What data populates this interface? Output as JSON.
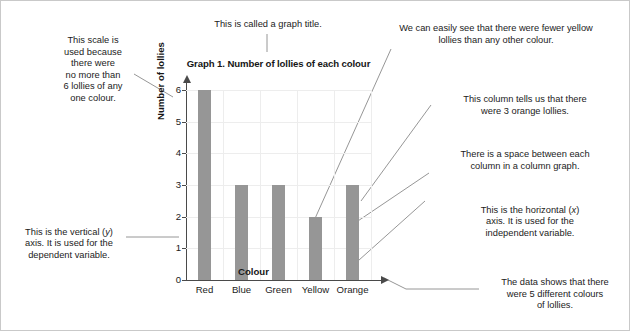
{
  "chart_data": {
    "type": "bar",
    "title": "Graph 1. Number of lollies of each colour",
    "categories": [
      "Red",
      "Blue",
      "Green",
      "Yellow",
      "Orange"
    ],
    "values": [
      6,
      3,
      3,
      2,
      3
    ],
    "xlabel": "Colour",
    "ylabel": "Number of lollies",
    "ylim": [
      0,
      6
    ],
    "yticks": [
      "0",
      "1",
      "2",
      "3",
      "4",
      "5",
      "6"
    ],
    "grid": true,
    "legend": "none",
    "bar_color": "#969696",
    "axis_color": "#4a4a4a",
    "grid_color": "#ededed"
  },
  "annotations": {
    "scale": "This scale is\nused because\nthere were\nno more than\n6 lollies of any\none colour.",
    "title_note": "This is called a graph title.",
    "yellow_note": "We can easily see that there were fewer yellow\nlollies than any other colour.",
    "orange_note": "This column tells us that there\nwere 3 orange lollies.",
    "space_note": "There is a space between each\ncolumn in a column graph.",
    "x_axis_note_pre": "This is the horizontal (",
    "x_axis_note_var": "x",
    "x_axis_note_post": ")\naxis. It is used for the\nindependent variable.",
    "y_axis_note_pre": "This is the vertical (",
    "y_axis_note_var": "y",
    "y_axis_note_post": ")\naxis. It is used for the\ndependent variable.",
    "colours_note": "The data shows that there\nwere 5 different colours\nof lollies."
  }
}
